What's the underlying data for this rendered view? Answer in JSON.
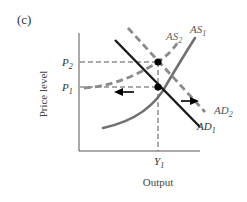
{
  "panel_label": "(c)",
  "axes": {
    "y_label": "Price level",
    "x_label": "Output"
  },
  "ticks": {
    "p2": {
      "main": "P",
      "sub": "2"
    },
    "p1": {
      "main": "P",
      "sub": "1"
    },
    "y1": {
      "main": "Y",
      "sub": "1"
    }
  },
  "curves": {
    "as1": {
      "main": "AS",
      "sub": "1",
      "style": "solid",
      "color": "#707070"
    },
    "as2": {
      "main": "AS",
      "sub": "2",
      "style": "dashed",
      "color": "#8a8a8a"
    },
    "ad1": {
      "main": "AD",
      "sub": "1",
      "style": "solid",
      "color": "#1a1a1a"
    },
    "ad2": {
      "main": "AD",
      "sub": "2",
      "style": "dashed",
      "color": "#8a8a8a"
    }
  },
  "colors": {
    "axis": "#555555",
    "guide": "#555555",
    "point": "#000000",
    "arrow": "#000000"
  }
}
